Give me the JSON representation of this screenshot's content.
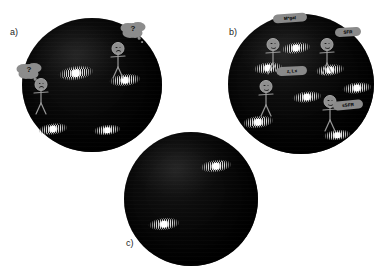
{
  "figure": {
    "background_color": "#ffffff",
    "sphere_color": "#000000",
    "accent_gray": "#8c8c8c",
    "galaxy_core_color": "#ffffff"
  },
  "panels": [
    {
      "id": "a",
      "label": "a)",
      "mood": "confused",
      "description": "Observable universe sphere with observers who cannot identify their galaxies",
      "observers": [
        {
          "face": "sad",
          "x": 41,
          "y": 78
        },
        {
          "face": "sad",
          "x": 118,
          "y": 42
        }
      ],
      "thought_bubbles": [
        {
          "text": "?",
          "x": 29,
          "y": 70
        },
        {
          "text": "?",
          "x": 133,
          "y": 29
        }
      ],
      "galaxies": [
        {
          "x": 76,
          "y": 73,
          "w": 36,
          "h": 15,
          "rot": -8
        },
        {
          "x": 125,
          "y": 80,
          "w": 32,
          "h": 13,
          "rot": -6
        },
        {
          "x": 53,
          "y": 129,
          "w": 30,
          "h": 12,
          "rot": -7
        },
        {
          "x": 107,
          "y": 130,
          "w": 28,
          "h": 11,
          "rot": -6
        }
      ]
    },
    {
      "id": "b",
      "label": "b)",
      "mood": "identified",
      "description": "Observable universe sphere where observers have named their galaxies",
      "observers": [
        {
          "face": "happy",
          "x": 273,
          "y": 38
        },
        {
          "face": "happy",
          "x": 327,
          "y": 38
        },
        {
          "face": "happy",
          "x": 266,
          "y": 80
        },
        {
          "face": "happy",
          "x": 330,
          "y": 95
        }
      ],
      "label_bubbles": [
        {
          "text": "M*gal",
          "x": 290,
          "y": 18,
          "w": 34,
          "h": 9,
          "rot": -4
        },
        {
          "text": "SFR",
          "x": 348,
          "y": 32,
          "w": 26,
          "h": 9,
          "rot": -3
        },
        {
          "text": "z, Lx",
          "x": 292,
          "y": 71,
          "w": 30,
          "h": 9,
          "rot": -3
        },
        {
          "text": "sSFR",
          "x": 348,
          "y": 105,
          "w": 30,
          "h": 9,
          "rot": -5
        }
      ],
      "galaxies": [
        {
          "x": 296,
          "y": 48,
          "w": 30,
          "h": 12,
          "rot": -7
        },
        {
          "x": 268,
          "y": 68,
          "w": 30,
          "h": 12,
          "rot": -6
        },
        {
          "x": 330,
          "y": 70,
          "w": 30,
          "h": 12,
          "rot": -7
        },
        {
          "x": 357,
          "y": 88,
          "w": 30,
          "h": 12,
          "rot": -6
        },
        {
          "x": 307,
          "y": 97,
          "w": 30,
          "h": 12,
          "rot": -6
        },
        {
          "x": 258,
          "y": 122,
          "w": 32,
          "h": 13,
          "rot": -7
        },
        {
          "x": 337,
          "y": 135,
          "w": 28,
          "h": 11,
          "rot": -6
        }
      ]
    },
    {
      "id": "c",
      "label": "c)",
      "mood": "empty",
      "description": "Observable universe sphere with galaxies but no observers",
      "observers": [],
      "thought_bubbles": [],
      "label_bubbles": [],
      "galaxies": [
        {
          "x": 216,
          "y": 166,
          "w": 32,
          "h": 13,
          "rot": -7
        },
        {
          "x": 164,
          "y": 224,
          "w": 32,
          "h": 13,
          "rot": -6
        }
      ]
    }
  ]
}
